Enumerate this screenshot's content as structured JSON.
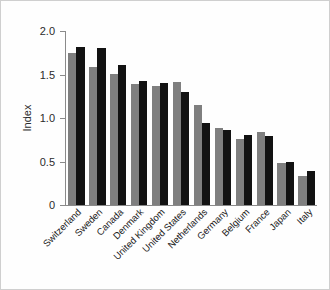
{
  "chart_data": {
    "type": "bar",
    "title": "",
    "xlabel": "",
    "ylabel": "Index",
    "ylim": [
      0,
      2.0
    ],
    "yticks": [
      0,
      0.5,
      1.0,
      1.5,
      2.0
    ],
    "ytick_labels": [
      "0",
      "0.5",
      "1.0",
      "1.5",
      "2.0"
    ],
    "grid": false,
    "legend": "none",
    "categories": [
      "Switzerland",
      "Sweden",
      "Canada",
      "Denmark",
      "United Kingdom",
      "United States",
      "Netherlands",
      "Germany",
      "Belgium",
      "France",
      "Japan",
      "Italy"
    ],
    "series": [
      {
        "name": "series-gray",
        "color": "#7f7f7f",
        "values": [
          1.75,
          1.59,
          1.51,
          1.39,
          1.37,
          1.41,
          1.15,
          0.89,
          0.76,
          0.84,
          0.48,
          0.33
        ]
      },
      {
        "name": "series-black",
        "color": "#121212",
        "values": [
          1.82,
          1.81,
          1.61,
          1.43,
          1.4,
          1.3,
          0.94,
          0.86,
          0.8,
          0.79,
          0.5,
          0.39
        ]
      }
    ]
  },
  "colors": {
    "gray": "#7f7f7f",
    "black": "#121212",
    "axis": "#8a8a8a",
    "frame": "#cfcfcf",
    "text": "#1a1a1a"
  }
}
